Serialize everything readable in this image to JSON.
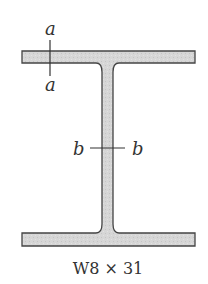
{
  "figure": {
    "section_label": "W8 × 31",
    "labels": {
      "a_top": "a",
      "a_bottom": "a",
      "b_left": "b",
      "b_right": "b"
    },
    "colors": {
      "fill": "#d4d4d4",
      "stroke": "#444444"
    }
  }
}
